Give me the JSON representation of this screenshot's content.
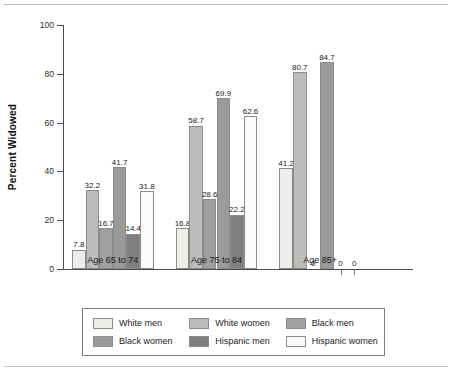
{
  "chart_data": {
    "type": "bar",
    "title": "",
    "xlabel": "",
    "ylabel": "Percent Widowed",
    "ylim": [
      0,
      100
    ],
    "yticks": [
      0,
      20,
      40,
      60,
      80,
      100
    ],
    "ytick_labels": [
      "0",
      "20",
      "40",
      "60",
      "80",
      "100"
    ],
    "grid": false,
    "legend_position": "bottom",
    "categories": [
      "Age 65 to 74",
      "Age 75 to 84",
      "Age 85+"
    ],
    "series": [
      {
        "name": "White men",
        "color": "#ededea",
        "values": [
          7.8,
          16.8,
          41.2
        ]
      },
      {
        "name": "White women",
        "color": "#bcbcba",
        "values": [
          32.2,
          58.7,
          80.7
        ]
      },
      {
        "name": "Black men",
        "color": "#a0a09e",
        "values": [
          16.7,
          28.6,
          0
        ]
      },
      {
        "name": "Black women",
        "color": "#9a9a98",
        "values": [
          41.7,
          69.9,
          84.7
        ]
      },
      {
        "name": "Hispanic men",
        "color": "#7f7f7d",
        "values": [
          14.4,
          22.2,
          0
        ]
      },
      {
        "name": "Hispanic women",
        "color": "#fbfbf9",
        "values": [
          31.8,
          62.6,
          0
        ]
      }
    ],
    "value_labels": [
      [
        "7.8",
        "32.2",
        "16.7",
        "41.7",
        "14.4",
        "31.8"
      ],
      [
        "16.8",
        "58.7",
        "28.6",
        "69.9",
        "22.2",
        "62.6"
      ],
      [
        "41.2",
        "80.7",
        "0",
        "84.7",
        "0",
        "0"
      ]
    ]
  },
  "legend": {
    "items": [
      {
        "label": "White men"
      },
      {
        "label": "White women"
      },
      {
        "label": "Black men"
      },
      {
        "label": "Black women"
      },
      {
        "label": "Hispanic men"
      },
      {
        "label": "Hispanic women"
      }
    ]
  },
  "colors": {
    "axis": "#4a4a4a",
    "bar_border": "#8b8b8b",
    "text": "#1b1b1b",
    "rule": "#b9b9b9"
  }
}
